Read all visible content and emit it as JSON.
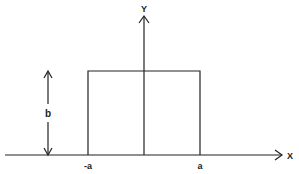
{
  "diagram": {
    "type": "rectangular pulse function",
    "axes": {
      "x_label": "X",
      "y_label": "Y"
    },
    "labels": {
      "height": "b",
      "left_edge": "-a",
      "right_edge": "a"
    },
    "colors": {
      "stroke": "#222222",
      "background": "#ffffff"
    }
  }
}
